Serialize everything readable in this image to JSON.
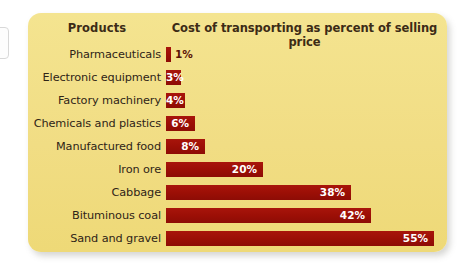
{
  "card": {
    "background_color": "#f2e08a",
    "bar_color": "#9e1008",
    "label_color": "#2f2417"
  },
  "header": {
    "products_label": "Products",
    "cost_label": "Cost of transporting as percent of selling price"
  },
  "chart_data": {
    "type": "bar",
    "orientation": "horizontal",
    "title": "Cost of transporting as percent of selling price",
    "xlabel": "Cost of transporting as percent of selling price",
    "ylabel": "Products",
    "xlim": [
      0,
      55
    ],
    "grid": false,
    "legend": null,
    "value_suffix": "%",
    "categories": [
      "Pharmaceuticals",
      "Electronic equipment",
      "Factory machinery",
      "Chemicals and plastics",
      "Manufactured food",
      "Iron ore",
      "Cabbage",
      "Bituminous coal",
      "Sand and gravel"
    ],
    "values": [
      1,
      3,
      4,
      6,
      8,
      20,
      38,
      42,
      55
    ],
    "labels": [
      "1%",
      "3%",
      "4%",
      "6%",
      "8%",
      "20%",
      "38%",
      "42%",
      "55%"
    ],
    "label_placement": [
      "outside",
      "inside",
      "inside",
      "inside",
      "inside",
      "inside",
      "inside",
      "inside",
      "inside"
    ]
  },
  "rows": [
    {
      "label": "Pharmaceuticals",
      "value": 1,
      "display": "1%",
      "placement": "outside"
    },
    {
      "label": "Electronic equipment",
      "value": 3,
      "display": "3%",
      "placement": "inside"
    },
    {
      "label": "Factory machinery",
      "value": 4,
      "display": "4%",
      "placement": "inside"
    },
    {
      "label": "Chemicals and plastics",
      "value": 6,
      "display": "6%",
      "placement": "inside"
    },
    {
      "label": "Manufactured food",
      "value": 8,
      "display": "8%",
      "placement": "inside"
    },
    {
      "label": "Iron ore",
      "value": 20,
      "display": "20%",
      "placement": "inside"
    },
    {
      "label": "Cabbage",
      "value": 38,
      "display": "38%",
      "placement": "inside"
    },
    {
      "label": "Bituminous coal",
      "value": 42,
      "display": "42%",
      "placement": "inside"
    },
    {
      "label": "Sand and gravel",
      "value": 55,
      "display": "55%",
      "placement": "inside"
    }
  ]
}
